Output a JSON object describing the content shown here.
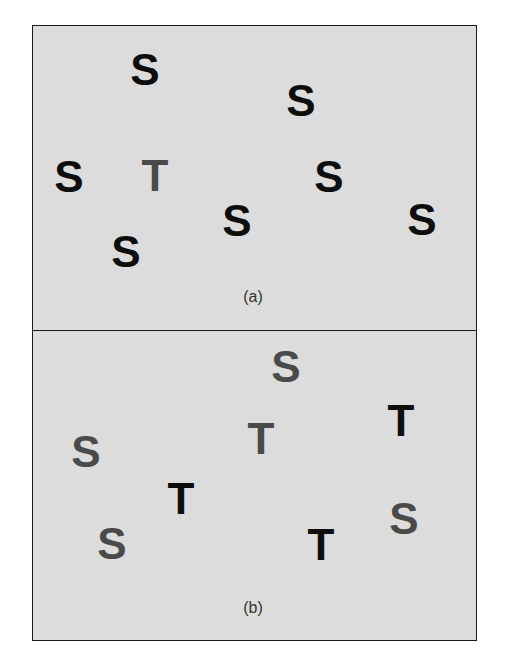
{
  "colors": {
    "dark": "#0d0d0d",
    "gray": "#4a4a4a",
    "background": "#dcdcdc",
    "border": "#1a1a1a"
  },
  "panels": [
    {
      "caption": "(a)",
      "letters": [
        {
          "char": "S",
          "x": 145,
          "y": 70,
          "shade": "dark"
        },
        {
          "char": "S",
          "x": 301,
          "y": 101,
          "shade": "dark"
        },
        {
          "char": "S",
          "x": 69,
          "y": 177,
          "shade": "dark"
        },
        {
          "char": "T",
          "x": 155,
          "y": 176,
          "shade": "gray"
        },
        {
          "char": "S",
          "x": 329,
          "y": 177,
          "shade": "dark"
        },
        {
          "char": "S",
          "x": 237,
          "y": 221,
          "shade": "dark"
        },
        {
          "char": "S",
          "x": 422,
          "y": 220,
          "shade": "dark"
        },
        {
          "char": "S",
          "x": 126,
          "y": 252,
          "shade": "dark"
        }
      ]
    },
    {
      "caption": "(b)",
      "letters": [
        {
          "char": "S",
          "x": 286,
          "y": 367,
          "shade": "gray"
        },
        {
          "char": "T",
          "x": 401,
          "y": 421,
          "shade": "dark"
        },
        {
          "char": "T",
          "x": 261,
          "y": 439,
          "shade": "gray"
        },
        {
          "char": "S",
          "x": 86,
          "y": 452,
          "shade": "gray"
        },
        {
          "char": "T",
          "x": 181,
          "y": 499,
          "shade": "dark"
        },
        {
          "char": "S",
          "x": 404,
          "y": 519,
          "shade": "gray"
        },
        {
          "char": "S",
          "x": 112,
          "y": 544,
          "shade": "gray"
        },
        {
          "char": "T",
          "x": 321,
          "y": 545,
          "shade": "dark"
        }
      ]
    }
  ],
  "captions": {
    "a": {
      "text": "(a)",
      "x": 253,
      "y": 297
    },
    "b": {
      "text": "(b)",
      "x": 253,
      "y": 608
    }
  }
}
